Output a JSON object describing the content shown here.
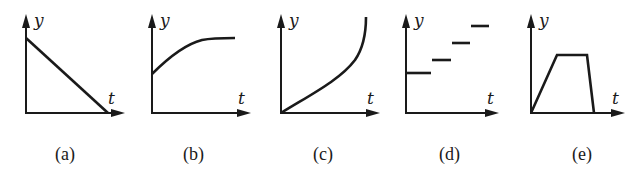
{
  "figure": {
    "axis_labels": {
      "y": "y",
      "x": "t"
    },
    "colors": {
      "ink": "#1a1a1a",
      "background": "#ffffff"
    },
    "panels": [
      {
        "id": "a",
        "label": "(a)",
        "description": "straight line decreasing from a positive y-intercept to zero"
      },
      {
        "id": "b",
        "label": "(b)",
        "description": "curve starting at positive y-intercept, increasing and leveling off"
      },
      {
        "id": "c",
        "label": "(c)",
        "description": "curve starting at origin, increasing with increasing slope"
      },
      {
        "id": "d",
        "label": "(d)",
        "description": "staircase of discrete horizontal segments increasing in steps"
      },
      {
        "id": "e",
        "label": "(e)",
        "description": "trapezoid: linear rise from origin, constant plateau, steep linear fall to zero"
      }
    ]
  }
}
